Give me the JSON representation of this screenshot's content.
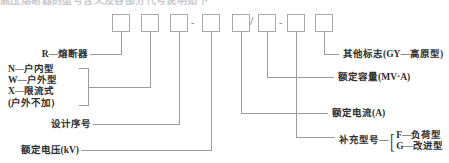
{
  "diagram": {
    "title_cut": "高压熔断器的型号含义及各部分代号说明如下",
    "boxes": [
      {
        "id": "box-1",
        "name": "series-letter-r",
        "sep_after": ""
      },
      {
        "id": "box-2",
        "name": "install-type",
        "sep_after": ""
      },
      {
        "id": "box-3",
        "name": "design-serial",
        "sep_after": "-"
      },
      {
        "id": "box-4",
        "name": "rated-voltage",
        "sep_after": ""
      },
      {
        "id": "box-5",
        "name": "rated-current",
        "sep_after": "/"
      },
      {
        "id": "box-6",
        "name": "rated-capacity",
        "sep_after": "-"
      },
      {
        "id": "box-7",
        "name": "supplement-model",
        "sep_after": ""
      },
      {
        "id": "box-8",
        "name": "other-mark",
        "sep_after": ""
      }
    ],
    "labels_left": {
      "fuse": "R—熔断器",
      "install_type": [
        "N—户内型",
        "W—户外型",
        "X—限流式",
        "(户外不加)"
      ],
      "design_serial": "设计序号",
      "rated_voltage": "额定电压(kV)"
    },
    "labels_right": {
      "other_mark": "其他标志(GY—高原型)",
      "rated_capacity": "额定容量(MV·A)",
      "rated_current": "额定电流(A)",
      "supplement_model": "补充型号—",
      "supplement_options": [
        "F—负荷型",
        "G—改进型"
      ]
    },
    "separators": {
      "dash": "-",
      "slash": "/"
    },
    "colors": {
      "line": "#9a9aa0",
      "box_border": "#a8a8ae",
      "text": "#2f2f2f",
      "background": "#ffffff"
    }
  }
}
